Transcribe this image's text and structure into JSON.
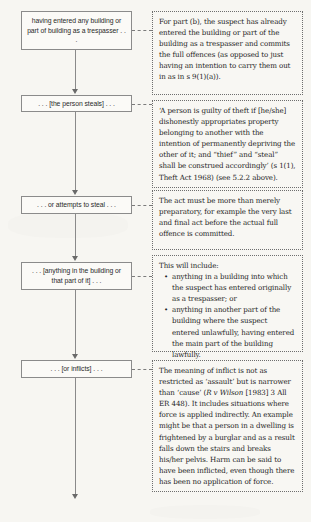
{
  "diagram": {
    "type": "flowchart",
    "background_color": "#f7f6f2",
    "box_border_color": "#8b8b8b",
    "panel_border_color": "#6e6e6e",
    "connector_color": "#8a8a8a",
    "steps": [
      {
        "id": "step-1",
        "box_label": "having entered any building or part of building as a trespasser . . .",
        "panel_text": "For part (b), the suspect has already entered the building or part of the building as a trespasser and commits the full offences (as opposed to just having an intention to carry them out in as in s 9(1)(a))."
      },
      {
        "id": "step-2",
        "box_label": ". . . [the person steals] . . .",
        "panel_text_pre": "‘A person is guilty of theft if [he/she] dishonestly appropriates property belonging to another with the intention of permanently depriving the other of it; and “thief” and “steal” shall be construed accordingly’ (s 1(1), Theft Act 1968) (see 5.2.2 above)."
      },
      {
        "id": "step-3",
        "box_label": ". . . or attempts to steal . . .",
        "panel_text": "The act must be more than merely preparatory, for example the very last and final act before the actual full offence is committed."
      },
      {
        "id": "step-4",
        "box_label": ". . . [anything in the building or that part of it] . . .",
        "panel_intro": "This will include:",
        "panel_bullets": [
          "anything in a building into which the suspect has entered originally as a trespasser; or",
          "anything in another part of the building where the suspect entered unlawfully, having entered the main part of the building lawfully."
        ]
      },
      {
        "id": "step-5",
        "box_label": ". . . [or inflicts] . . .",
        "panel_parts": {
          "a": "The meaning of inflict is not as restricted as ‘assault’ but is narrower than ‘cause’ (",
          "case_citation": "R v Wilson",
          "b": " [1983] 3 All ER 448). It includes situations where force is applied indirectly. An example might be that a person in a dwelling is frightened by a burglar and as a result falls down the stairs and breaks his/her pelvis. Harm can be said to have been inflicted, even though there has been no application of force."
        }
      }
    ]
  }
}
